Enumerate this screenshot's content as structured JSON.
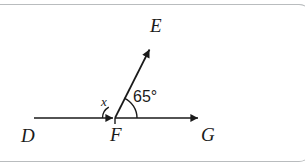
{
  "figure": {
    "type": "geometry-diagram",
    "points": {
      "D": {
        "label": "D",
        "x": 31,
        "y": 118
      },
      "F": {
        "label": "F",
        "x": 115,
        "y": 118
      },
      "G": {
        "label": "G",
        "x": 201,
        "y": 118
      },
      "E": {
        "label": "E",
        "x": 152,
        "y": 45
      }
    },
    "angles": {
      "unknown": {
        "label": "x",
        "vertex": "F",
        "between": "FD and FE"
      },
      "known": {
        "label": "65°",
        "value": 65,
        "unit": "degrees",
        "vertex": "F",
        "between": "FE and FG"
      }
    },
    "colors": {
      "stroke": "#1a1a1a",
      "border": "#b9bcbe",
      "background": "#ffffff"
    }
  }
}
